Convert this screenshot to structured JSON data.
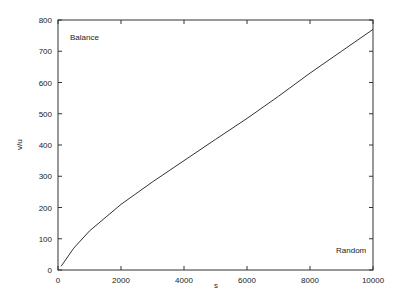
{
  "chart_data": {
    "type": "line",
    "title": "",
    "xlabel": "s",
    "ylabel": "v/u",
    "xlim": [
      0,
      10000
    ],
    "ylim": [
      0,
      800
    ],
    "xticks": [
      "0",
      "2000",
      "4000",
      "6000",
      "8000",
      "10000"
    ],
    "yticks": [
      "0",
      "100",
      "200",
      "300",
      "400",
      "500",
      "600",
      "700",
      "800"
    ],
    "grid": false,
    "annotations": [
      "Balance",
      "Random"
    ],
    "series": [
      {
        "name": "v/u",
        "x": [
          100,
          500,
          1000,
          2000,
          3000,
          4000,
          5000,
          6000,
          7000,
          8000,
          9000,
          10000
        ],
        "values": [
          12,
          70,
          125,
          210,
          282,
          350,
          418,
          485,
          556,
          630,
          700,
          770
        ]
      }
    ]
  }
}
